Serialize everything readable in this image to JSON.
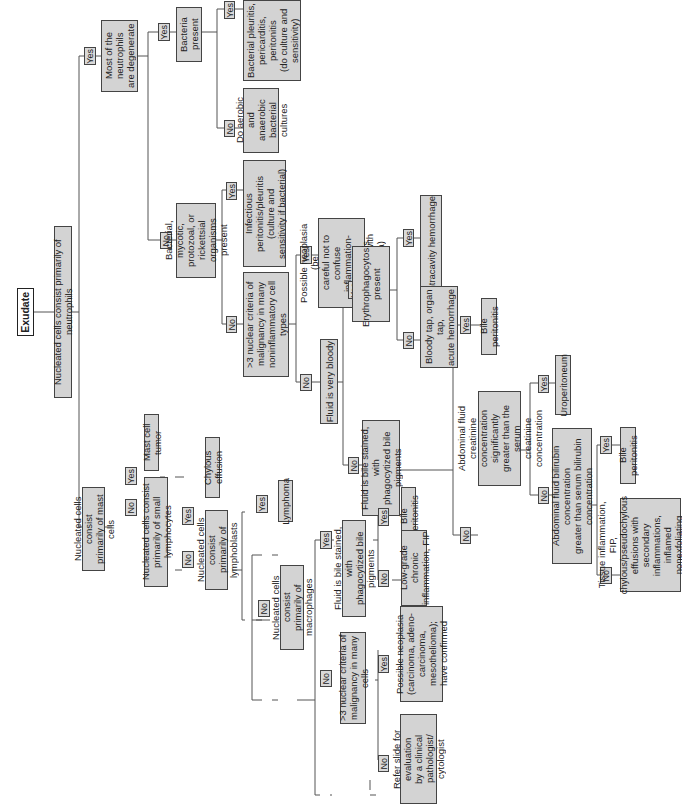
{
  "diagram": {
    "orientation": "rotated-90-ccw",
    "root": "Exudate",
    "nodes": {
      "exudate": "Exudate",
      "neutrophils": "Nucleated cells consist primarily of neutrophils",
      "degenerate": "Most of the neutrophils\nare degenerate",
      "bacteria": "Bacteria present",
      "bact_yes": "Bacterial pleuritis,\npericarditis,\nperitonitis\n(do culture and\nsensitivity)",
      "bact_no": "Do aerobic and\nanaerobic\nbacterial cultures",
      "organisms": "Bacterial, mycotic,\nprotozoal, or rickettsial\norganisms present",
      "infectious": "Infectious peritonitis/pleuritis\n(culture and\nsensitivity if bacterial)",
      "criteria_noninfl": ">3 nuclear criteria of\nmalignancy in many\nnoninflammatory cell types",
      "possible_neo_careful": "Possible neoplasia (be\ncareful not to confuse\ninflammation-induced\ndysplasia with neoplasia)",
      "very_bloody": "Fluid is very bloody",
      "erythro": "Erythrophagocytosis\npresent",
      "intracavity": "Intracavity hemorrhage",
      "bloody_tap": "Bloody tap, organ tap,\nacute hemorrhage",
      "bile_stained_1": "Fluid is bile stained, with\nphagocytized bile pigments",
      "bile_peritonitis_1": "Bile peritonitis",
      "creatinine": "Abdominal fluid creatinine\nconcentration significantly\ngreater than the serum\ncreatinine concentration",
      "uroperitoneum": "Uroperitoneum",
      "bilirubin": "Abdominal fluid bilirubin concentration\ngreater than serum bilirubin\nconcentration",
      "bile_peritonitis_2": "Bile peritonitis",
      "tissue_infl": "Tissue inflammation, FIP,\nchylous/pseudochylous\neffusions with secondary\ninflammations, inflamed\nnonexfoliating neoplasia,\nother",
      "mast": "Nucleated cells consist\nprimarily of mast cells",
      "mast_tumor": "Mast cell tumor",
      "small_lymph": "Nucleated cells consist\nprimarily of small lymphocytes",
      "chylous": "Chylous effusion",
      "lymphoblasts": "Nucleated cells consist\nprimarily of lymphoblasts",
      "lymphoma": "Lymphoma",
      "macrophages": "Nucleated cells consist\nprimarily of macrophages",
      "bile_stained_2": "Fluid is bile stained, with\nphagocytized bile pigments",
      "bile_peritonitis_3": "Bile peritonitis",
      "low_grade": "Low-grade chronic\ninflammation, FIP",
      "criteria_many": ">3 nuclear criteria of\nmalignancy in many cells",
      "possible_neo_confirmed": "Possible neoplasia\n(carcinoma, adeno-\ncarcinoma, mesothelioma);\nhave confirmed",
      "refer": "Refer slide for evaluation\nby a clinical pathologist/\ncytologist"
    },
    "labels": {
      "yes": "Yes",
      "no": "No"
    }
  }
}
